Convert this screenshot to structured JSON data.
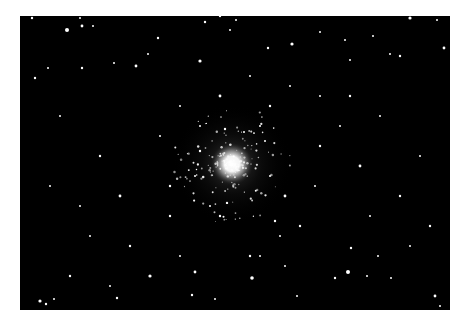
{
  "image": {
    "subject": "Globular star cluster",
    "background_color": "#ffffff",
    "sky_color": "#000000",
    "frame": {
      "x": 20,
      "y": 16,
      "width": 430,
      "height": 294
    },
    "cluster_center": {
      "x": 212,
      "y": 148
    },
    "cluster_core_radius": 14,
    "cluster_halo_radius": 60
  },
  "stars": [
    [
      12,
      2,
      1.2
    ],
    [
      60,
      2,
      1
    ],
    [
      47,
      14,
      2
    ],
    [
      62,
      10,
      1.4
    ],
    [
      73,
      10,
      1
    ],
    [
      138,
      22,
      1.2
    ],
    [
      185,
      6,
      1.2
    ],
    [
      200,
      0,
      1.2
    ],
    [
      216,
      4,
      1
    ],
    [
      248,
      32,
      1.2
    ],
    [
      272,
      28,
      1.6
    ],
    [
      300,
      16,
      1
    ],
    [
      210,
      14,
      1
    ],
    [
      180,
      45,
      1.6
    ],
    [
      116,
      50,
      1.4
    ],
    [
      128,
      38,
      1
    ],
    [
      62,
      52,
      1.2
    ],
    [
      94,
      47,
      1
    ],
    [
      28,
      52,
      1
    ],
    [
      390,
      2,
      1.6
    ],
    [
      417,
      4,
      1
    ],
    [
      424,
      32,
      1.4
    ],
    [
      353,
      20,
      1
    ],
    [
      325,
      24,
      1
    ],
    [
      370,
      38,
      1
    ],
    [
      380,
      40,
      1.2
    ],
    [
      330,
      44,
      1
    ],
    [
      15,
      62,
      1.2
    ],
    [
      40,
      100,
      1
    ],
    [
      80,
      140,
      1.2
    ],
    [
      30,
      170,
      1
    ],
    [
      100,
      180,
      1.4
    ],
    [
      70,
      220,
      1
    ],
    [
      50,
      260,
      1.2
    ],
    [
      130,
      260,
      1.6
    ],
    [
      160,
      240,
      1
    ],
    [
      90,
      270,
      1
    ],
    [
      20,
      285,
      1.6
    ],
    [
      26,
      288,
      1.2
    ],
    [
      34,
      283,
      1
    ],
    [
      97,
      282,
      1.2
    ],
    [
      175,
      256,
      1.4
    ],
    [
      172,
      279,
      1.2
    ],
    [
      195,
      283,
      1
    ],
    [
      230,
      240,
      1.2
    ],
    [
      232,
      262,
      1.8
    ],
    [
      240,
      240,
      1
    ],
    [
      265,
      250,
      1
    ],
    [
      277,
      280,
      1
    ],
    [
      315,
      262,
      1.2
    ],
    [
      328,
      256,
      2
    ],
    [
      331,
      232,
      1.2
    ],
    [
      347,
      260,
      1
    ],
    [
      358,
      240,
      1
    ],
    [
      371,
      262,
      1
    ],
    [
      415,
      280,
      1.4
    ],
    [
      420,
      290,
      1
    ],
    [
      295,
      170,
      1
    ],
    [
      300,
      130,
      1.2
    ],
    [
      320,
      110,
      1
    ],
    [
      340,
      150,
      1.4
    ],
    [
      360,
      100,
      1
    ],
    [
      380,
      180,
      1.2
    ],
    [
      400,
      140,
      1
    ],
    [
      410,
      210,
      1.2
    ],
    [
      390,
      230,
      1
    ],
    [
      350,
      200,
      1
    ],
    [
      280,
      210,
      1.2
    ],
    [
      260,
      220,
      1
    ],
    [
      150,
      200,
      1.2
    ],
    [
      140,
      120,
      1
    ],
    [
      160,
      90,
      1
    ],
    [
      250,
      90,
      1.2
    ],
    [
      270,
      70,
      1
    ],
    [
      230,
      60,
      1
    ],
    [
      200,
      80,
      1.4
    ],
    [
      180,
      110,
      1
    ],
    [
      300,
      80,
      1
    ],
    [
      330,
      80,
      1.2
    ],
    [
      440,
      100,
      1
    ],
    [
      60,
      190,
      1
    ],
    [
      110,
      230,
      1.2
    ],
    [
      150,
      170,
      1.2
    ],
    [
      265,
      180,
      1.4
    ],
    [
      255,
      205,
      1.2
    ],
    [
      190,
      190,
      1
    ],
    [
      200,
      200,
      1.2
    ],
    [
      240,
      110,
      1
    ],
    [
      245,
      125,
      1
    ],
    [
      180,
      135,
      1.2
    ],
    [
      175,
      160,
      1
    ],
    [
      250,
      160,
      1
    ],
    [
      205,
      113,
      1.2
    ],
    [
      224,
      116,
      1
    ]
  ],
  "icons": {
    "star-field": "starfield-icon"
  }
}
